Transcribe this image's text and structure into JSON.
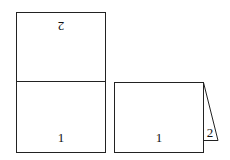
{
  "diagram": {
    "unfolded": {
      "top_panel_label": "2",
      "top_label_rotated": true,
      "bottom_panel_label": "1"
    },
    "folded": {
      "front_label": "1",
      "back_flap_label": "2"
    },
    "colors": {
      "stroke": "#222222",
      "background": "#ffffff"
    }
  }
}
